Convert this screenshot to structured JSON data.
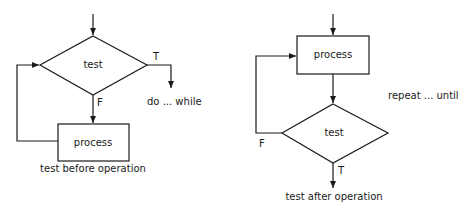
{
  "diagrams": [
    {
      "id": "test-before-operation",
      "caption": "test before operation",
      "decision_label": "test",
      "process_label": "process",
      "true_label": "T",
      "false_label": "F",
      "exit_label": "do ... while"
    },
    {
      "id": "test-after-operation",
      "caption": "test after operation",
      "decision_label": "test",
      "process_label": "process",
      "true_label": "T",
      "false_label": "F",
      "side_label": "repeat ... until"
    }
  ],
  "colors": {
    "stroke": "#1a1a1a",
    "background": "#ffffff"
  }
}
